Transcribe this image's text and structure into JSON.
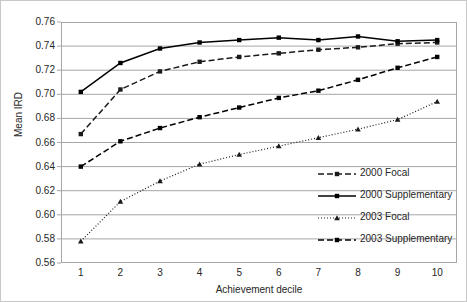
{
  "chart_data": {
    "type": "line",
    "title": "",
    "xlabel": "Achievement decile",
    "ylabel": "Mean IRD",
    "categories": [
      "1",
      "2",
      "3",
      "4",
      "5",
      "6",
      "7",
      "8",
      "9",
      "10"
    ],
    "x": [
      1,
      2,
      3,
      4,
      5,
      6,
      7,
      8,
      9,
      10
    ],
    "xlim": [
      0.5,
      10.5
    ],
    "ylim": [
      0.56,
      0.76
    ],
    "yticks": [
      "0.76",
      "0.74",
      "0.72",
      "0.70",
      "0.68",
      "0.66",
      "0.64",
      "0.62",
      "0.60",
      "0.58",
      "0.56"
    ],
    "ytick_values": [
      0.76,
      0.74,
      0.72,
      0.7,
      0.68,
      0.66,
      0.64,
      0.62,
      0.6,
      0.58,
      0.56
    ],
    "grid": "horizontal",
    "legend_position": "inside-right",
    "series": [
      {
        "name": "2000 Focal",
        "linestyle": "dashed",
        "marker": "square",
        "color": "#1a1a1a",
        "values": [
          0.667,
          0.704,
          0.719,
          0.727,
          0.731,
          0.734,
          0.737,
          0.739,
          0.742,
          0.743
        ]
      },
      {
        "name": "2000 Supplementary",
        "linestyle": "solid",
        "marker": "square",
        "color": "#000000",
        "values": [
          0.702,
          0.726,
          0.738,
          0.743,
          0.745,
          0.747,
          0.745,
          0.748,
          0.744,
          0.745
        ]
      },
      {
        "name": "2003 Focal",
        "linestyle": "dotted",
        "marker": "triangle",
        "color": "#1a1a1a",
        "values": [
          0.578,
          0.611,
          0.628,
          0.642,
          0.65,
          0.657,
          0.664,
          0.671,
          0.679,
          0.694
        ]
      },
      {
        "name": "2003 Supplementary",
        "linestyle": "dashed",
        "marker": "square",
        "color": "#000000",
        "values": [
          0.64,
          0.661,
          0.672,
          0.681,
          0.689,
          0.697,
          0.703,
          0.712,
          0.722,
          0.731
        ]
      }
    ]
  },
  "legend": {
    "items": [
      {
        "label": "2000 Focal"
      },
      {
        "label": "2000 Supplementary"
      },
      {
        "label": "2003 Focal"
      },
      {
        "label": "2003 Supplementary"
      }
    ]
  },
  "colors": {
    "grid": "#a6a6a6",
    "frame": "#a6a6a6",
    "text": "#262626",
    "series": "#000000"
  }
}
